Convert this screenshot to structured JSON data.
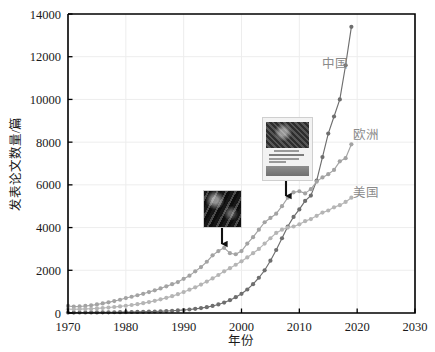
{
  "chart_data": {
    "type": "line",
    "title": "",
    "xlabel": "年份",
    "ylabel": "发表论文数量/篇",
    "xlim": [
      1970,
      2030
    ],
    "ylim": [
      0,
      14000
    ],
    "xticks": [
      1970,
      1980,
      1990,
      2000,
      2010,
      2020,
      2030
    ],
    "yticks": [
      0,
      2000,
      4000,
      6000,
      8000,
      10000,
      12000,
      14000
    ],
    "grid": true,
    "legend_position": "inline-right-of-series",
    "marker": "circle",
    "series": [
      {
        "name": "中国",
        "label": "中国",
        "color": "#6e6e6e",
        "label_x": 2016.2,
        "label_y": 11450,
        "x": [
          1970,
          1971,
          1972,
          1973,
          1974,
          1975,
          1976,
          1977,
          1978,
          1979,
          1980,
          1981,
          1982,
          1983,
          1984,
          1985,
          1986,
          1987,
          1988,
          1989,
          1990,
          1991,
          1992,
          1993,
          1994,
          1995,
          1996,
          1997,
          1998,
          1999,
          2000,
          2001,
          2002,
          2003,
          2004,
          2005,
          2006,
          2007,
          2008,
          2009,
          2010,
          2011,
          2012,
          2013,
          2014,
          2015,
          2016,
          2017,
          2018,
          2019
        ],
        "y": [
          20,
          22,
          24,
          25,
          27,
          28,
          30,
          32,
          35,
          38,
          42,
          46,
          50,
          55,
          62,
          70,
          80,
          92,
          105,
          120,
          140,
          165,
          195,
          230,
          275,
          330,
          400,
          490,
          600,
          740,
          900,
          1100,
          1350,
          1650,
          2000,
          2450,
          2950,
          3500,
          4050,
          4500,
          4850,
          5250,
          5500,
          6200,
          7300,
          8400,
          9200,
          10000,
          11600,
          13400
        ]
      },
      {
        "name": "欧洲",
        "label": "欧洲",
        "color": "#a3a3a3",
        "label_x": 2021.6,
        "label_y": 8150,
        "x": [
          1970,
          1971,
          1972,
          1973,
          1974,
          1975,
          1976,
          1977,
          1978,
          1979,
          1980,
          1981,
          1982,
          1983,
          1984,
          1985,
          1986,
          1987,
          1988,
          1989,
          1990,
          1991,
          1992,
          1993,
          1994,
          1995,
          1996,
          1997,
          1998,
          1999,
          2000,
          2001,
          2002,
          2003,
          2004,
          2005,
          2006,
          2007,
          2008,
          2009,
          2010,
          2011,
          2012,
          2013,
          2014,
          2015,
          2016,
          2017,
          2018,
          2019
        ],
        "y": [
          330,
          300,
          310,
          330,
          360,
          400,
          450,
          500,
          560,
          620,
          700,
          760,
          830,
          900,
          980,
          1060,
          1150,
          1250,
          1350,
          1450,
          1600,
          1750,
          1950,
          2150,
          2400,
          2700,
          2900,
          3050,
          2800,
          2750,
          2900,
          3250,
          3550,
          3900,
          4250,
          4450,
          4650,
          5000,
          5400,
          5650,
          5700,
          5600,
          5800,
          6150,
          6350,
          6500,
          6700,
          7100,
          7250,
          7900
        ]
      },
      {
        "name": "美国",
        "label": "美国",
        "color": "#b5b5b5",
        "label_x": 2021.6,
        "label_y": 5450,
        "x": [
          1970,
          1971,
          1972,
          1973,
          1974,
          1975,
          1976,
          1977,
          1978,
          1979,
          1980,
          1981,
          1982,
          1983,
          1984,
          1985,
          1986,
          1987,
          1988,
          1989,
          1990,
          1991,
          1992,
          1993,
          1994,
          1995,
          1996,
          1997,
          1998,
          1999,
          2000,
          2001,
          2002,
          2003,
          2004,
          2005,
          2006,
          2007,
          2008,
          2009,
          2010,
          2011,
          2012,
          2013,
          2014,
          2015,
          2016,
          2017,
          2018,
          2019
        ],
        "y": [
          180,
          175,
          180,
          190,
          200,
          215,
          235,
          255,
          280,
          310,
          340,
          375,
          415,
          460,
          510,
          570,
          640,
          710,
          790,
          880,
          980,
          1090,
          1200,
          1330,
          1470,
          1620,
          1780,
          1950,
          2100,
          2260,
          2420,
          2600,
          2800,
          3000,
          3250,
          3500,
          3750,
          3900,
          4000,
          4050,
          4150,
          4300,
          4400,
          4550,
          4700,
          4800,
          4950,
          5050,
          5200,
          5400
        ]
      }
    ],
    "annotations": [
      {
        "name": "inset-image-left",
        "kind": "image-thumbnail",
        "description": "深色书籍/期刊封面缩略图",
        "arrow": "down",
        "points_to_year": 1998,
        "points_to_series": "欧洲"
      },
      {
        "name": "inset-image-right",
        "kind": "image-thumbnail",
        "description": "期刊封面缩略图（Surface Analysis）",
        "arrow": "down",
        "points_to_year": 2008,
        "points_to_series": "欧洲"
      }
    ]
  },
  "axes": {
    "y_tick_labels": [
      "0",
      "2000",
      "4000",
      "6000",
      "8000",
      "10000",
      "12000",
      "14000"
    ],
    "x_tick_labels": [
      "1970",
      "1980",
      "1990",
      "2000",
      "2010",
      "2020",
      "2030"
    ],
    "x_axis_title": "年份",
    "y_axis_title": "发表论文数量/篇"
  },
  "colors": {
    "axis": "#000000",
    "grid": "#ededed",
    "china": "#6e6e6e",
    "europe": "#a3a3a3",
    "usa": "#b5b5b5",
    "label_text": "#8a8a8a",
    "background": "#ffffff"
  }
}
